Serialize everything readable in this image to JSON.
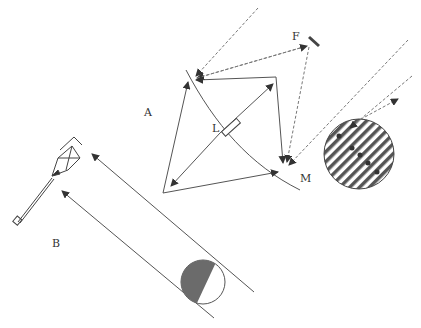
{
  "labels": {
    "A": "A",
    "B": "B",
    "F": "F",
    "L": "L",
    "M": "M"
  },
  "colors": {
    "line": "#555555",
    "dashed": "#777777",
    "moon_shadow": "#6b6b6b",
    "hatch": "#555555",
    "background": "#ffffff"
  }
}
